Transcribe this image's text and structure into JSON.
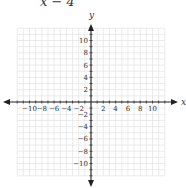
{
  "equation_fragment": "x − 4",
  "chart_data": {
    "type": "scatter",
    "title": "",
    "xlabel": "x",
    "ylabel": "y",
    "xlim": [
      -12,
      12
    ],
    "ylim": [
      -12,
      12
    ],
    "grid": true,
    "x_ticks": [
      -10,
      -8,
      -6,
      -4,
      -2,
      2,
      4,
      6,
      8,
      10
    ],
    "y_ticks": [
      10,
      8,
      6,
      4,
      2,
      -2,
      -4,
      -6,
      -8,
      -10
    ],
    "series": []
  }
}
